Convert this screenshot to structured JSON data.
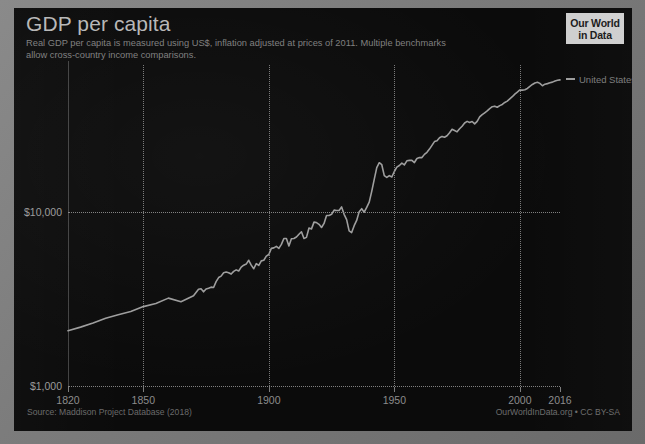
{
  "header": {
    "title": "GDP per capita",
    "subtitle": "Real GDP per capita is measured using US$, inflation adjusted at prices of 2011. Multiple benchmarks allow cross-country income comparisons."
  },
  "logo": {
    "line1": "Our World",
    "line2": "in Data"
  },
  "footer": {
    "source": "Source: Maddison Project Database (2018)",
    "attribution": "OurWorldInData.org • CC BY-SA"
  },
  "colors": {
    "background": "#0b0b0b",
    "frame": "#7c7c7c",
    "line": "#9d9d9d",
    "grid": "#8d8d8d",
    "title": "#b7b7b7",
    "subtitle": "#7f7f7f",
    "axis_text": "#8b8b8b"
  },
  "series_label": "United States",
  "chart_data": {
    "type": "line",
    "title": "GDP per capita",
    "subtitle": "Real GDP per capita is measured using US$, inflation adjusted at prices of 2011. Multiple benchmarks allow cross-country income comparisons.",
    "xlabel": "",
    "ylabel": "",
    "yscale": "log",
    "ylim": [
      1000,
      70000
    ],
    "xlim": [
      1820,
      2016
    ],
    "grid": true,
    "legend_position": "right-inline",
    "xticks": [
      1820,
      1850,
      1900,
      1950,
      2000,
      2016
    ],
    "xticklabels": [
      "1820",
      "1850",
      "1900",
      "1950",
      "2000",
      "2016"
    ],
    "yticks": [
      1000,
      10000
    ],
    "yticklabels": [
      "$1,000",
      "$10,000"
    ],
    "source": "Maddison Project Database (2018)",
    "series": [
      {
        "name": "United States",
        "color": "#9d9d9d",
        "x": [
          1820,
          1825,
          1830,
          1835,
          1840,
          1845,
          1850,
          1855,
          1860,
          1865,
          1870,
          1871,
          1872,
          1873,
          1874,
          1875,
          1876,
          1877,
          1878,
          1879,
          1880,
          1881,
          1882,
          1883,
          1884,
          1885,
          1886,
          1887,
          1888,
          1889,
          1890,
          1891,
          1892,
          1893,
          1894,
          1895,
          1896,
          1897,
          1898,
          1899,
          1900,
          1901,
          1902,
          1903,
          1904,
          1905,
          1906,
          1907,
          1908,
          1909,
          1910,
          1911,
          1912,
          1913,
          1914,
          1915,
          1916,
          1917,
          1918,
          1919,
          1920,
          1921,
          1922,
          1923,
          1924,
          1925,
          1926,
          1927,
          1928,
          1929,
          1930,
          1931,
          1932,
          1933,
          1934,
          1935,
          1936,
          1937,
          1938,
          1939,
          1940,
          1941,
          1942,
          1943,
          1944,
          1945,
          1946,
          1947,
          1948,
          1949,
          1950,
          1951,
          1952,
          1953,
          1954,
          1955,
          1956,
          1957,
          1958,
          1959,
          1960,
          1961,
          1962,
          1963,
          1964,
          1965,
          1966,
          1967,
          1968,
          1969,
          1970,
          1971,
          1972,
          1973,
          1974,
          1975,
          1976,
          1977,
          1978,
          1979,
          1980,
          1981,
          1982,
          1983,
          1984,
          1985,
          1986,
          1987,
          1988,
          1989,
          1990,
          1991,
          1992,
          1993,
          1994,
          1995,
          1996,
          1997,
          1998,
          1999,
          2000,
          2001,
          2002,
          2003,
          2004,
          2005,
          2006,
          2007,
          2008,
          2009,
          2010,
          2011,
          2012,
          2013,
          2014,
          2015,
          2016
        ],
        "y": [
          2080,
          2180,
          2300,
          2450,
          2570,
          2680,
          2860,
          2980,
          3200,
          3050,
          3300,
          3450,
          3600,
          3620,
          3480,
          3610,
          3650,
          3700,
          3680,
          3980,
          4200,
          4280,
          4480,
          4520,
          4480,
          4400,
          4560,
          4650,
          4580,
          4820,
          4950,
          5020,
          5280,
          4950,
          4720,
          5050,
          4930,
          5240,
          5280,
          5580,
          5700,
          6180,
          6220,
          6350,
          6180,
          6520,
          7050,
          7050,
          6380,
          7020,
          7050,
          7180,
          7450,
          7700,
          7050,
          7150,
          8100,
          8000,
          8750,
          8700,
          8500,
          8150,
          8600,
          9550,
          9550,
          9700,
          10250,
          10200,
          10200,
          10700,
          9700,
          9050,
          7800,
          7620,
          8350,
          8950,
          10050,
          10450,
          9980,
          10650,
          11400,
          13150,
          15400,
          18000,
          19200,
          18700,
          16200,
          15800,
          16200,
          15900,
          17100,
          18100,
          18500,
          19100,
          18650,
          19700,
          19800,
          19800,
          19250,
          20300,
          20550,
          20550,
          21450,
          22050,
          23000,
          24150,
          25400,
          25700,
          26700,
          27200,
          26900,
          27450,
          28550,
          29900,
          29400,
          28900,
          30100,
          31100,
          32500,
          33200,
          32700,
          33150,
          32100,
          33200,
          35200,
          36300,
          37200,
          38100,
          39300,
          40300,
          40600,
          40000,
          40900,
          41550,
          42650,
          43400,
          44700,
          46000,
          47600,
          48900,
          50300,
          50200,
          50500,
          51300,
          52800,
          54100,
          55200,
          55700,
          54900,
          53200,
          54300,
          54700,
          55300,
          55800,
          56600,
          57200,
          57500
        ]
      }
    ]
  }
}
